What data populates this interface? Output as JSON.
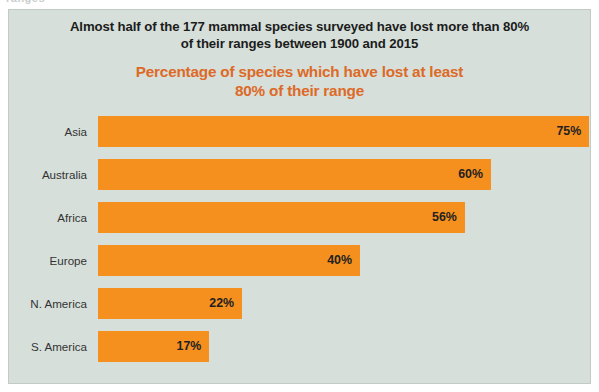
{
  "ghost": {
    "clipped_text": "ranges"
  },
  "figure": {
    "title": "Almost half of the 177 mammal species surveyed have lost more than 80% of their ranges between 1900 and 2015",
    "title_line_1": "Almost half of the 177 mammal species surveyed have lost more than 80%",
    "title_line_2": "of their ranges between 1900 and 2015",
    "subtitle_line_1": "Percentage of species which have lost at least",
    "subtitle_line_2": "80% of their range",
    "background_color": "#d6dfda",
    "bar_color": "#f5901f",
    "subtitle_color": "#dd6a27",
    "title_color": "#1c1c1c"
  },
  "chart_data": {
    "type": "bar",
    "orientation": "horizontal",
    "title": "Percentage of species which have lost at least 80% of their range",
    "subtitle": "Almost half of the 177 mammal species surveyed have lost more than 80% of their ranges between 1900 and 2015",
    "xlabel": "",
    "ylabel": "",
    "grid": false,
    "legend": false,
    "xlim": [
      0,
      80
    ],
    "categories": [
      "Asia",
      "Australia",
      "Africa",
      "Europe",
      "N. America",
      "S. America"
    ],
    "values": [
      75,
      60,
      56,
      40,
      22,
      17
    ],
    "value_labels": [
      "75%",
      "60%",
      "56%",
      "40%",
      "22%",
      "17%"
    ],
    "series": [
      {
        "name": "Percentage of species which have lost at least 80% of their range",
        "color": "#f5901f",
        "values": [
          75,
          60,
          56,
          40,
          22,
          17
        ]
      }
    ],
    "bars": [
      {
        "category": "Asia",
        "value": 75,
        "label": "75%"
      },
      {
        "category": "Australia",
        "value": 60,
        "label": "60%"
      },
      {
        "category": "Africa",
        "value": 56,
        "label": "56%"
      },
      {
        "category": "Europe",
        "value": 40,
        "label": "40%"
      },
      {
        "category": "N. America",
        "value": 22,
        "label": "22%"
      },
      {
        "category": "S. America",
        "value": 17,
        "label": "17%"
      }
    ]
  }
}
